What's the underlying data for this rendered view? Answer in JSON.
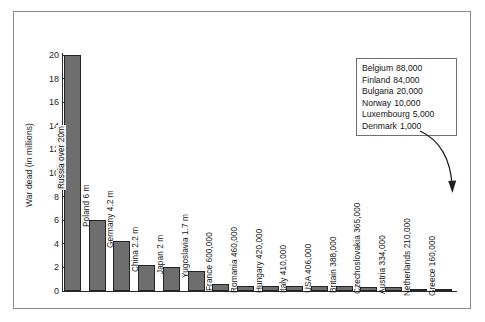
{
  "chart_data": {
    "type": "bar",
    "title": "",
    "xlabel": "",
    "ylabel": "War dead (in millions)",
    "ylim": [
      0,
      20
    ],
    "ytick_labels": [
      "20",
      "18",
      "16",
      "14",
      "12",
      "10",
      "8",
      "6",
      "4",
      "2",
      "0"
    ],
    "ytick_values": [
      20,
      18,
      16,
      14,
      12,
      10,
      8,
      6,
      4,
      2,
      0
    ],
    "grid": false,
    "legend": "none",
    "categories": [
      "Russia",
      "Poland",
      "Germany",
      "China",
      "Japan",
      "Yugoslavia",
      "France",
      "Romania",
      "Hungary",
      "Italy",
      "USA",
      "Britain",
      "Czechoslovakia",
      "Austria",
      "Netherlands",
      "Greece"
    ],
    "values": [
      20,
      6,
      4.2,
      2.2,
      2,
      1.7,
      0.6,
      0.46,
      0.42,
      0.41,
      0.406,
      0.388,
      0.365,
      0.334,
      0.21,
      0.16
    ],
    "bar_labels": [
      "Russia over 20m",
      "Poland 6 m",
      "Germany 4.2 m",
      "China 2.2 m",
      "Japan 2 m",
      "Yugoslavia 1.7 m",
      "France 600,000",
      "Romania 460,000",
      "Hungary 420,000",
      "Italy 410,000",
      "USA 406,000",
      "Britain 388,000",
      "Czechoslovakia 365,000",
      "Austria 334,000",
      "Netherlands 210,000",
      "Greece 160,000"
    ],
    "annotation_box": {
      "rows": [
        {
          "country": "Belgium",
          "value": "88,000"
        },
        {
          "country": "Finland",
          "value": "84,000"
        },
        {
          "country": "Bulgaria",
          "value": "20,000"
        },
        {
          "country": "Norway",
          "value": "10,000"
        },
        {
          "country": "Luxembourg",
          "value": "5,000"
        },
        {
          "country": "Denmark",
          "value": "1,000"
        }
      ]
    },
    "colors": {
      "bar_fill": "#6e6e6e",
      "bar_stroke": "#232323",
      "axis": "#2a2a2a",
      "frame": "#8b8b8b",
      "text": "#151515",
      "background": "#ffffff"
    }
  }
}
